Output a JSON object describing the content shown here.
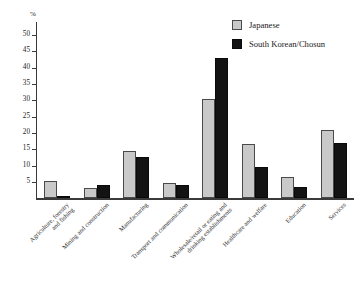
{
  "chart_data": {
    "type": "bar",
    "title": "",
    "subtitle": "",
    "xlabel": "",
    "ylabel": "%",
    "ylim": [
      0,
      54
    ],
    "yticks": [
      5,
      10,
      15,
      20,
      25,
      30,
      35,
      40,
      45,
      50
    ],
    "ytick_labels": [
      "5",
      "10",
      "15",
      "20",
      "25",
      "30",
      "35",
      "40",
      "45",
      "50"
    ],
    "grid": false,
    "legend_position": "top-right",
    "categories": [
      "Agriculture, forestry\nand fishing",
      "Mining and construction",
      "Manufacturing",
      "Transport and communication",
      "Wholesale/retail or eating and\ndrinking establishments",
      "Healthcare and welfare",
      "Education",
      "Services"
    ],
    "series": [
      {
        "name": "Japanese",
        "color": "#c9c9c9",
        "values": [
          5.2,
          3.1,
          14.5,
          4.6,
          30.5,
          16.8,
          6.5,
          20.8
        ]
      },
      {
        "name": "South Korean/Chosun",
        "color": "#131313",
        "values": [
          0.8,
          4.2,
          12.6,
          4.2,
          43.1,
          9.5,
          3.5,
          17.1
        ]
      }
    ]
  },
  "legend": {
    "items": [
      {
        "label": "Japanese",
        "key": "japanese"
      },
      {
        "label": "South Korean/Chosun",
        "key": "korean"
      }
    ]
  }
}
